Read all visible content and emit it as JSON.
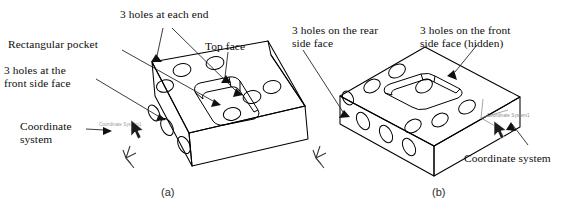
{
  "figure": {
    "background_color": "#ffffff",
    "line_color": "#000000",
    "cad_label_color": "#8d8d92"
  },
  "panels": [
    {
      "id": "a",
      "caption": "(a)",
      "cad_coordinate_label": "Coordinate System1",
      "callouts": [
        {
          "name": "holes-each-end",
          "text": "3 holes at each end"
        },
        {
          "name": "rectangular-pocket",
          "text": "Rectangular pocket"
        },
        {
          "name": "top-face",
          "text": "Top face"
        },
        {
          "name": "holes-front-side-face",
          "text": "3 holes at the\nfront side face"
        },
        {
          "name": "coordinate-system",
          "text": "Coordinate\nsystem"
        }
      ]
    },
    {
      "id": "b",
      "caption": "(b)",
      "cad_coordinate_label": "Coordinate System1",
      "callouts": [
        {
          "name": "holes-rear-side-face",
          "text": "3 holes on the rear\nside face"
        },
        {
          "name": "holes-front-side-face-hidden",
          "text": "3 holes on the front\nside face (hidden)"
        },
        {
          "name": "coordinate-system",
          "text": "Coordinate system"
        }
      ]
    }
  ]
}
